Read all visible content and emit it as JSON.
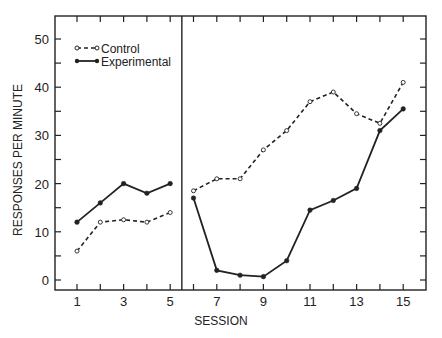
{
  "chart_data": {
    "type": "line",
    "title": "",
    "xlabel": "SESSION",
    "ylabel": "RESPONSES PER MINUTE",
    "ylim": [
      0,
      55
    ],
    "xlim": [
      0,
      16
    ],
    "yticks_labeled": [
      0,
      10,
      20,
      30,
      40,
      50
    ],
    "xticks_labeled": [
      1,
      3,
      5,
      7,
      9,
      11,
      13,
      15
    ],
    "phase_divider_after_session": 5.5,
    "legend": {
      "position": "upper-left",
      "entries": [
        "Control",
        "Experimental"
      ]
    },
    "grid": false,
    "series": [
      {
        "name": "Control",
        "style": "dashed-open-circle",
        "phases": [
          {
            "x": [
              1,
              2,
              3,
              4,
              5
            ],
            "y": [
              6,
              12,
              12.5,
              12,
              14
            ]
          },
          {
            "x": [
              6,
              7,
              8,
              9,
              10,
              11,
              12,
              13,
              14,
              15
            ],
            "y": [
              18.5,
              21,
              21,
              27,
              31,
              37,
              39,
              34.5,
              32.5,
              41
            ]
          }
        ]
      },
      {
        "name": "Experimental",
        "style": "solid-filled-circle",
        "phases": [
          {
            "x": [
              1,
              2,
              3,
              4,
              5
            ],
            "y": [
              12,
              16,
              20,
              18,
              20
            ]
          },
          {
            "x": [
              6,
              7,
              8,
              9,
              10,
              11,
              12,
              13,
              14,
              15
            ],
            "y": [
              17,
              2,
              1,
              0.7,
              4,
              14.5,
              16.5,
              19,
              31,
              35.5
            ]
          }
        ]
      }
    ]
  },
  "legend": {
    "control": "Control",
    "experimental": "Experimental"
  },
  "axes": {
    "xlabel": "SESSION",
    "ylabel": "RESPONSES PER MINUTE"
  }
}
